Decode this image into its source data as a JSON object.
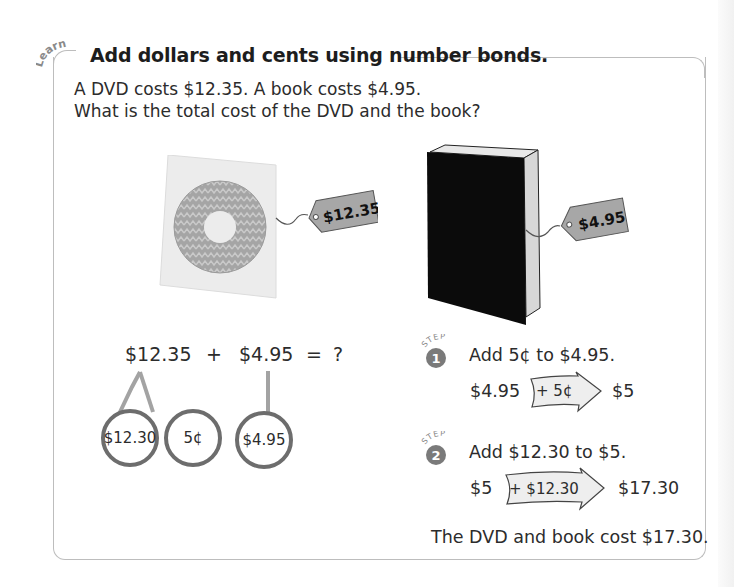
{
  "section": {
    "tag": "Learn",
    "title": "Add dollars and cents using number bonds."
  },
  "problem": {
    "line1": "A DVD costs $12.35. A book costs $4.95.",
    "line2": "What is the total cost of the DVD and the book?"
  },
  "items": {
    "dvd": {
      "name": "DVD",
      "price_tag": "$12.35"
    },
    "book": {
      "name": "Book",
      "price_tag": "$4.95"
    }
  },
  "number_bond": {
    "addend1": "$12.35",
    "plus": "+",
    "addend2": "$4.95",
    "equals": "=",
    "unknown": "?",
    "parts": [
      "$12.30",
      "5¢",
      "$4.95"
    ]
  },
  "steps": [
    {
      "tag": "STEP",
      "number": "1",
      "instruction": "Add 5¢ to $4.95.",
      "start": "$4.95",
      "operation": "+ 5¢",
      "result": "$5"
    },
    {
      "tag": "STEP",
      "number": "2",
      "instruction": "Add $12.30 to $5.",
      "start": "$5",
      "operation": "+ $12.30",
      "result": "$17.30"
    }
  ],
  "conclusion": "The DVD and book cost $17.30.",
  "colors": {
    "border": "#bdbdbd",
    "bond_circle": "#6d6d6d",
    "bond_line": "#a3a3a3",
    "price_tag": "#a7a7a7",
    "step_badge": "#7a7a7a",
    "arrow_fill": "#eeeeee"
  }
}
